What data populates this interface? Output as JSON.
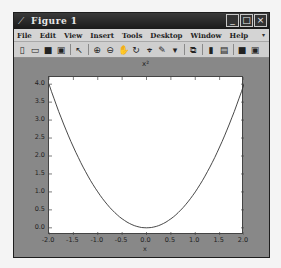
{
  "window": {
    "title": "Figure 1",
    "controls": {
      "minimize": "_",
      "maximize": "□",
      "close": "×"
    }
  },
  "menubar": {
    "items": [
      "File",
      "Edit",
      "View",
      "Insert",
      "Tools",
      "Desktop",
      "Window",
      "Help"
    ],
    "overflow_arrow": "▾"
  },
  "toolbar": {
    "icons": [
      {
        "name": "new-figure-icon",
        "glyph": "▯"
      },
      {
        "name": "open-file-icon",
        "glyph": "▭"
      },
      {
        "name": "save-icon",
        "glyph": "■"
      },
      {
        "name": "print-icon",
        "glyph": "▣"
      },
      {
        "name": "sep"
      },
      {
        "name": "edit-plot-arrow-icon",
        "glyph": "↖"
      },
      {
        "name": "sep"
      },
      {
        "name": "zoom-in-icon",
        "glyph": "⊕"
      },
      {
        "name": "zoom-out-icon",
        "glyph": "⊖"
      },
      {
        "name": "pan-hand-icon",
        "glyph": "✋"
      },
      {
        "name": "rotate-3d-icon",
        "glyph": "↻"
      },
      {
        "name": "data-cursor-icon",
        "glyph": "⌖"
      },
      {
        "name": "brush-icon",
        "glyph": "✎"
      },
      {
        "name": "brush-dropdown-icon",
        "glyph": "▾"
      },
      {
        "name": "sep"
      },
      {
        "name": "link-plot-icon",
        "glyph": "⧉"
      },
      {
        "name": "sep"
      },
      {
        "name": "insert-colorbar-icon",
        "glyph": "▮"
      },
      {
        "name": "insert-legend-icon",
        "glyph": "▤"
      },
      {
        "name": "sep"
      },
      {
        "name": "hide-plot-tools-icon",
        "glyph": "■"
      },
      {
        "name": "show-plot-tools-icon",
        "glyph": "▣"
      }
    ]
  },
  "chart_data": {
    "type": "line",
    "title": "x²",
    "xlabel": "x",
    "ylabel": "",
    "xlim": [
      -2.0,
      2.0
    ],
    "ylim": [
      -0.2,
      4.2
    ],
    "xticks": [
      "-2.0",
      "-1.5",
      "-1.0",
      "-0.5",
      "0.0",
      "0.5",
      "1.0",
      "1.5",
      "2.0"
    ],
    "yticks": [
      "0.0",
      "0.5",
      "1.0",
      "1.5",
      "2.0",
      "2.5",
      "3.0",
      "3.5",
      "4.0"
    ],
    "grid": false,
    "series": [
      {
        "name": "x^2",
        "color": "#333333",
        "x": [
          -2.0,
          -1.75,
          -1.5,
          -1.25,
          -1.0,
          -0.75,
          -0.5,
          -0.25,
          0.0,
          0.25,
          0.5,
          0.75,
          1.0,
          1.25,
          1.5,
          1.75,
          2.0
        ],
        "y": [
          4.0,
          3.0625,
          2.25,
          1.5625,
          1.0,
          0.5625,
          0.25,
          0.0625,
          0.0,
          0.0625,
          0.25,
          0.5625,
          1.0,
          1.5625,
          2.25,
          3.0625,
          4.0
        ]
      }
    ]
  },
  "colors": {
    "figure_bg": "#888888",
    "title_bar": "#1a1a1a",
    "menu_bg": "#d4d4d4",
    "axes_bg": "#ffffff",
    "line": "#333333"
  }
}
